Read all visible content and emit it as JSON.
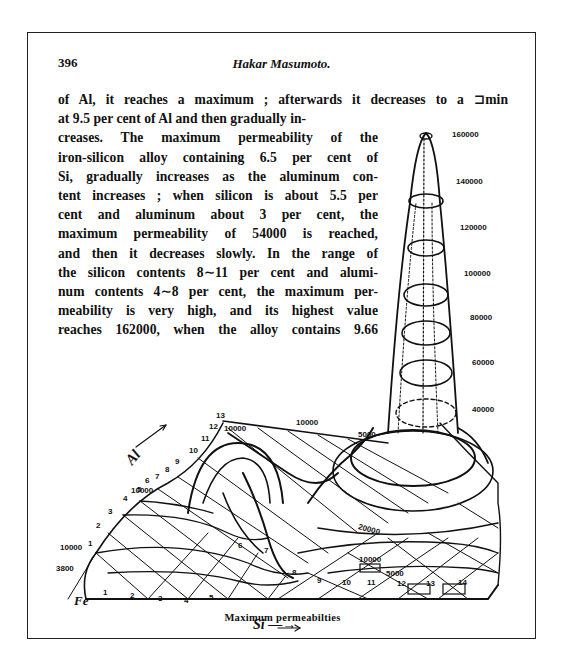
{
  "page": {
    "number": "396",
    "running_head": "Hakar Masumoto."
  },
  "body_text": {
    "lines": [
      "of Al, it reaches a maximum ; afterwards it decreases to a ⊐min",
      "at 9.5 per cent of Al and then gradually in-",
      "creases.  The maximum permeability of the",
      "iron-silicon  alloy containing 6.5 per cent of",
      "Si, gradually increases as the aluminum con-",
      "tent increases ; when silicon is about 5.5 per",
      "cent and aluminum about 3 per cent, the",
      "maximum permeability of 54000 is reached,",
      "and then it decreases slowly.  In the range of",
      "the silicon contents 8∼11 per cent and alumi-",
      "num contents 4∼8 per cent, the maximum per-",
      "meability is very high, and its highest value",
      "reaches 162000, when the alloy contains 9.66"
    ]
  },
  "figure": {
    "caption": "Maximum permeabilties",
    "axis_si": "Si —→",
    "axis_al": "Al",
    "origin_label": "Fe",
    "height_scale_labels": [
      "160000",
      "140000",
      "120000",
      "100000",
      "80000",
      "60000",
      "40000"
    ],
    "si_ticks": [
      "1",
      "2",
      "3",
      "4",
      "5",
      "6",
      "7",
      "8",
      "9",
      "10",
      "11",
      "12",
      "13",
      "14"
    ],
    "al_ticks": [
      "1",
      "2",
      "3",
      "4",
      "5",
      "6",
      "7",
      "8",
      "9",
      "10",
      "11",
      "12",
      "13"
    ],
    "contour_labels": {
      "fe_corner_low": "3800",
      "fe_corner_high": "10000",
      "al_axis": "10000",
      "al_top": "10000",
      "ridge_top": "10000",
      "ridge_right": "5000",
      "peak_base": "20000",
      "front_inner": "10000",
      "front_outer": "5000"
    }
  }
}
